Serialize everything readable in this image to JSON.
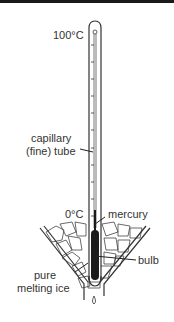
{
  "diagram": {
    "labels": {
      "top_mark": "100°C",
      "capillary_line1": "capillary",
      "capillary_line2": "(fine) tube",
      "bottom_mark": "0°C",
      "mercury": "mercury",
      "bulb": "bulb",
      "ice_line1": "pure",
      "ice_line2": "melting ice"
    },
    "colors": {
      "line": "#333333",
      "mercury": "#1a1a1a",
      "background": "#ffffff"
    }
  }
}
